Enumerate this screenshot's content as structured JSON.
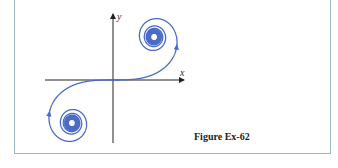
{
  "figure": {
    "caption": "Figure Ex-62",
    "axes": {
      "x_label": "x",
      "y_label": "y"
    },
    "curve": {
      "description": "Cornu spiral (clothoid) passing through the origin, spiraling into two limit points",
      "color": "#4a6bc8",
      "arrows": "direction of increasing parameter, toward upper-right spiral"
    },
    "colors": {
      "frame": "#9bb8cc",
      "axis": "#222222",
      "curve": "#4a6bc8"
    }
  }
}
